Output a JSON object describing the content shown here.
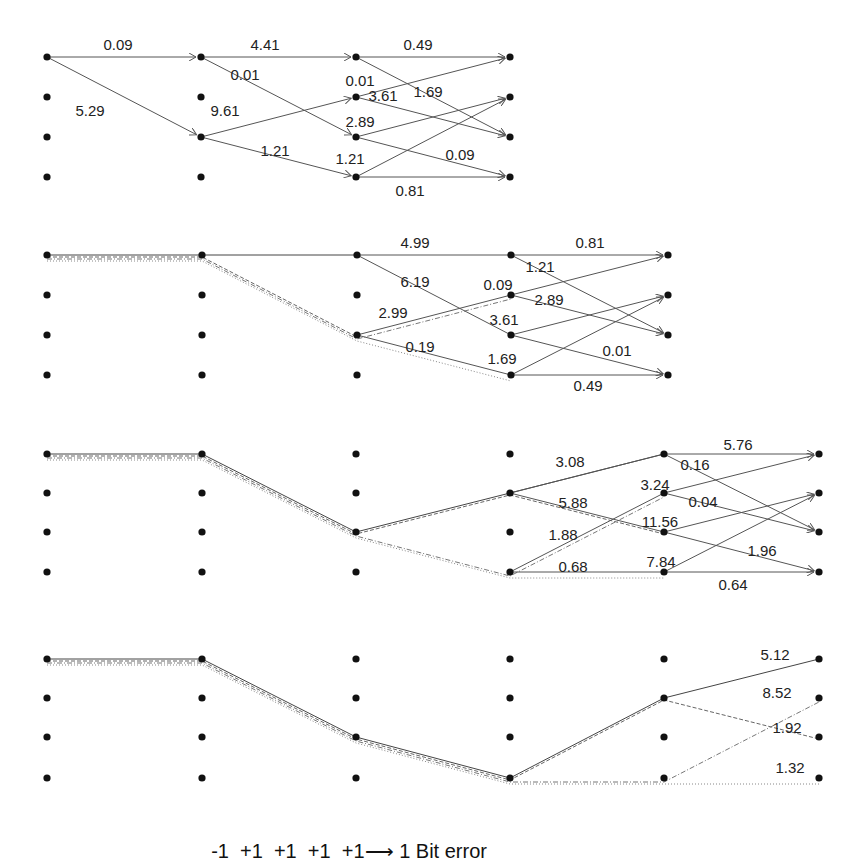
{
  "caption": {
    "sequence": [
      "-1",
      "+1",
      "+1",
      "+1",
      "+1"
    ],
    "arrow": "⟶",
    "result": "1 Bit error"
  },
  "panels": [
    {
      "name": "stage-1",
      "columns_x": [
        47,
        201,
        356,
        510
      ],
      "rows_y": [
        57,
        97,
        137,
        177
      ],
      "edges": [
        {
          "from": [
            0,
            0
          ],
          "to": [
            1,
            0
          ],
          "label": "0.09",
          "lx": 118,
          "ly": 50
        },
        {
          "from": [
            0,
            0
          ],
          "to": [
            1,
            2
          ],
          "label": "5.29",
          "lx": 90,
          "ly": 116
        },
        {
          "from": [
            1,
            0
          ],
          "to": [
            2,
            0
          ],
          "label": "4.41",
          "lx": 265,
          "ly": 50
        },
        {
          "from": [
            1,
            0
          ],
          "to": [
            2,
            2
          ],
          "label": "0.01",
          "lx": 245,
          "ly": 80
        },
        {
          "from": [
            1,
            2
          ],
          "to": [
            2,
            1
          ],
          "label": "9.61",
          "lx": 225,
          "ly": 116
        },
        {
          "from": [
            1,
            2
          ],
          "to": [
            2,
            3
          ],
          "label": "1.21",
          "lx": 275,
          "ly": 156
        },
        {
          "from": [
            2,
            0
          ],
          "to": [
            3,
            0
          ],
          "label": "0.49",
          "lx": 418,
          "ly": 50
        },
        {
          "from": [
            2,
            0
          ],
          "to": [
            3,
            2
          ],
          "label": "1.69",
          "lx": 428,
          "ly": 97
        },
        {
          "from": [
            2,
            1
          ],
          "to": [
            3,
            0
          ],
          "label": "0.01",
          "lx": 360,
          "ly": 86
        },
        {
          "from": [
            2,
            1
          ],
          "to": [
            3,
            2
          ],
          "label": "3.61",
          "lx": 383,
          "ly": 101
        },
        {
          "from": [
            2,
            2
          ],
          "to": [
            3,
            1
          ],
          "label": "2.89",
          "lx": 360,
          "ly": 127
        },
        {
          "from": [
            2,
            2
          ],
          "to": [
            3,
            3
          ],
          "label": "0.09",
          "lx": 460,
          "ly": 160
        },
        {
          "from": [
            2,
            3
          ],
          "to": [
            3,
            1
          ],
          "label": "1.21",
          "lx": 350,
          "ly": 164
        },
        {
          "from": [
            2,
            3
          ],
          "to": [
            3,
            3
          ],
          "label": "0.81",
          "lx": 410,
          "ly": 196
        }
      ]
    },
    {
      "name": "stage-2",
      "columns_x": [
        47,
        202,
        357,
        511,
        668
      ],
      "rows_y": [
        255,
        295,
        335,
        375
      ],
      "survivors": [
        {
          "points": [
            [
              0,
              0
            ],
            [
              1,
              0
            ],
            [
              2,
              0
            ]
          ],
          "style": "solid"
        },
        {
          "points": [
            [
              0,
              0
            ],
            [
              1,
              0
            ],
            [
              2,
              2
            ]
          ],
          "style": "dash"
        },
        {
          "points": [
            [
              0,
              0
            ],
            [
              1,
              0
            ],
            [
              2,
              2
            ],
            [
              3,
              3
            ]
          ],
          "style": "dot"
        },
        {
          "points": [
            [
              0,
              0
            ],
            [
              1,
              0
            ],
            [
              2,
              2
            ],
            [
              3,
              1
            ]
          ],
          "style": "dashdot"
        }
      ],
      "edges": [
        {
          "from": [
            2,
            0
          ],
          "to": [
            3,
            0
          ],
          "label": "4.99",
          "lx": 415,
          "ly": 248,
          "plain": true
        },
        {
          "from": [
            2,
            0
          ],
          "to": [
            3,
            2
          ],
          "label": "6.19",
          "lx": 415,
          "ly": 287,
          "plain": true
        },
        {
          "from": [
            2,
            2
          ],
          "to": [
            3,
            1
          ],
          "label": "2.99",
          "lx": 393,
          "ly": 318,
          "plain": true
        },
        {
          "from": [
            2,
            2
          ],
          "to": [
            3,
            3
          ],
          "label": "0.19",
          "lx": 420,
          "ly": 352,
          "plain": true
        },
        {
          "from": [
            3,
            0
          ],
          "to": [
            4,
            0
          ],
          "label": "0.81",
          "lx": 590,
          "ly": 248
        },
        {
          "from": [
            3,
            0
          ],
          "to": [
            4,
            2
          ],
          "label": "1.21",
          "lx": 540,
          "ly": 272
        },
        {
          "from": [
            3,
            1
          ],
          "to": [
            4,
            0
          ],
          "label": "0.09",
          "lx": 498,
          "ly": 290
        },
        {
          "from": [
            3,
            1
          ],
          "to": [
            4,
            2
          ],
          "label": "2.89",
          "lx": 549,
          "ly": 305
        },
        {
          "from": [
            3,
            2
          ],
          "to": [
            4,
            1
          ],
          "label": "3.61",
          "lx": 504,
          "ly": 325
        },
        {
          "from": [
            3,
            2
          ],
          "to": [
            4,
            3
          ],
          "label": "0.01",
          "lx": 617,
          "ly": 356
        },
        {
          "from": [
            3,
            3
          ],
          "to": [
            4,
            1
          ],
          "label": "1.69",
          "lx": 502,
          "ly": 364
        },
        {
          "from": [
            3,
            3
          ],
          "to": [
            4,
            3
          ],
          "label": "0.49",
          "lx": 588,
          "ly": 391
        }
      ]
    },
    {
      "name": "stage-3",
      "columns_x": [
        47,
        202,
        356,
        510,
        664,
        819
      ],
      "rows_y": [
        454,
        493,
        532,
        572
      ],
      "survivors": [
        {
          "points": [
            [
              0,
              0
            ],
            [
              1,
              0
            ],
            [
              2,
              2
            ],
            [
              3,
              1
            ],
            [
              4,
              0
            ]
          ],
          "style": "solid"
        },
        {
          "points": [
            [
              0,
              0
            ],
            [
              1,
              0
            ],
            [
              2,
              2
            ],
            [
              3,
              1
            ],
            [
              4,
              2
            ]
          ],
          "style": "dash"
        },
        {
          "points": [
            [
              0,
              0
            ],
            [
              1,
              0
            ],
            [
              2,
              2
            ],
            [
              3,
              3
            ],
            [
              4,
              1
            ]
          ],
          "style": "dashdot"
        },
        {
          "points": [
            [
              0,
              0
            ],
            [
              1,
              0
            ],
            [
              2,
              2
            ],
            [
              3,
              3
            ],
            [
              4,
              3
            ]
          ],
          "style": "dot"
        }
      ],
      "edges": [
        {
          "from": [
            3,
            1
          ],
          "to": [
            4,
            0
          ],
          "label": "3.08",
          "lx": 570,
          "ly": 467,
          "plain": true
        },
        {
          "from": [
            3,
            1
          ],
          "to": [
            4,
            2
          ],
          "label": "5.88",
          "lx": 573,
          "ly": 508,
          "plain": true
        },
        {
          "from": [
            3,
            3
          ],
          "to": [
            4,
            1
          ],
          "label": "1.88",
          "lx": 563,
          "ly": 540,
          "plain": true
        },
        {
          "from": [
            3,
            3
          ],
          "to": [
            4,
            3
          ],
          "label": "0.68",
          "lx": 573,
          "ly": 572,
          "plain": true
        },
        {
          "from": [
            4,
            0
          ],
          "to": [
            5,
            0
          ],
          "label": "5.76",
          "lx": 738,
          "ly": 450
        },
        {
          "from": [
            4,
            0
          ],
          "to": [
            5,
            2
          ],
          "label": "0.16",
          "lx": 695,
          "ly": 470
        },
        {
          "from": [
            4,
            1
          ],
          "to": [
            5,
            0
          ],
          "label": "3.24",
          "lx": 655,
          "ly": 490
        },
        {
          "from": [
            4,
            1
          ],
          "to": [
            5,
            2
          ],
          "label": "0.04",
          "lx": 703,
          "ly": 507
        },
        {
          "from": [
            4,
            2
          ],
          "to": [
            5,
            1
          ],
          "label": "11.56",
          "lx": 660,
          "ly": 527
        },
        {
          "from": [
            4,
            2
          ],
          "to": [
            5,
            3
          ],
          "label": "1.96",
          "lx": 762,
          "ly": 556
        },
        {
          "from": [
            4,
            3
          ],
          "to": [
            5,
            1
          ],
          "label": "7.84",
          "lx": 661,
          "ly": 567
        },
        {
          "from": [
            4,
            3
          ],
          "to": [
            5,
            3
          ],
          "label": "0.64",
          "lx": 733,
          "ly": 590
        }
      ]
    },
    {
      "name": "stage-4",
      "columns_x": [
        47,
        202,
        356,
        510,
        664,
        819
      ],
      "rows_y": [
        659,
        698,
        737,
        778
      ],
      "survivors": [
        {
          "points": [
            [
              0,
              0
            ],
            [
              1,
              0
            ],
            [
              2,
              2
            ],
            [
              3,
              3
            ],
            [
              4,
              1
            ],
            [
              5,
              0
            ]
          ],
          "style": "solid"
        },
        {
          "points": [
            [
              0,
              0
            ],
            [
              1,
              0
            ],
            [
              2,
              2
            ],
            [
              3,
              3
            ],
            [
              4,
              1
            ],
            [
              5,
              2
            ]
          ],
          "style": "dash"
        },
        {
          "points": [
            [
              0,
              0
            ],
            [
              1,
              0
            ],
            [
              2,
              2
            ],
            [
              3,
              3
            ],
            [
              4,
              3
            ],
            [
              5,
              1
            ]
          ],
          "style": "dashdot"
        },
        {
          "points": [
            [
              0,
              0
            ],
            [
              1,
              0
            ],
            [
              2,
              2
            ],
            [
              3,
              3
            ],
            [
              4,
              3
            ],
            [
              5,
              3
            ]
          ],
          "style": "dot"
        }
      ],
      "end_labels": [
        {
          "label": "5.12",
          "lx": 775,
          "ly": 660
        },
        {
          "label": "8.52",
          "lx": 777,
          "ly": 698
        },
        {
          "label": "1.92",
          "lx": 787,
          "ly": 733
        },
        {
          "label": "1.32",
          "lx": 790,
          "ly": 773
        }
      ]
    }
  ],
  "colors": {
    "node": "#111111",
    "edge": "#555555",
    "text": "#222222",
    "background": "#ffffff"
  }
}
